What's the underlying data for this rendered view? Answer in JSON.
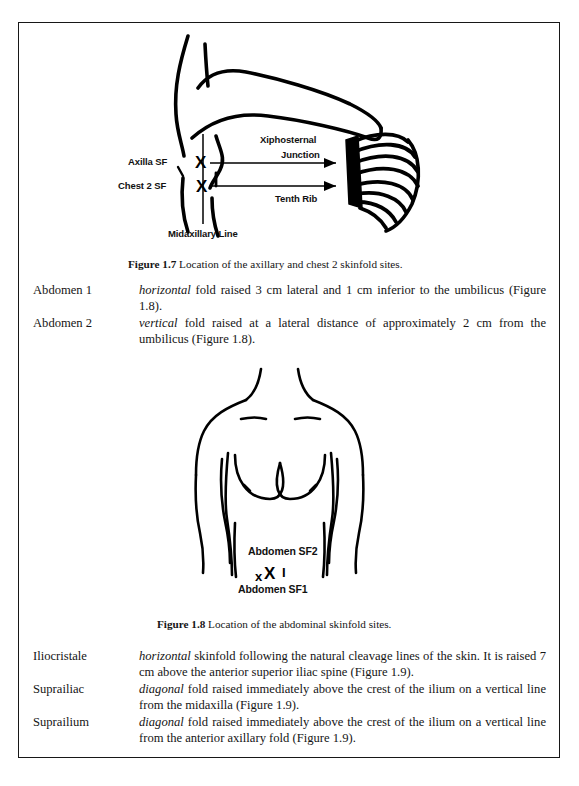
{
  "page": {
    "background_color": "#ffffff",
    "frame_color": "#171717",
    "text_color": "#151515"
  },
  "figure_1_7": {
    "id": "figure-1-7",
    "caption_label": "Figure 1.7",
    "caption_text": "Location of the axillary and chest 2 skinfold sites.",
    "annotations": [
      {
        "name": "axilla-sf-label",
        "text": "Axilla SF"
      },
      {
        "name": "chest-2-sf-label",
        "text": "Chest 2 SF"
      },
      {
        "name": "midaxillary-line-label",
        "text": "Midaxillary Line"
      },
      {
        "name": "xiphosternal-label-line1",
        "text": "Xiphosternal"
      },
      {
        "name": "xiphosternal-label-line2",
        "text": "Junction"
      },
      {
        "name": "tenth-rib-label",
        "text": "Tenth Rib"
      }
    ],
    "markers": [
      {
        "name": "axilla-sf-marker",
        "glyph": "X"
      },
      {
        "name": "chest-2-sf-marker",
        "glyph": "X"
      }
    ]
  },
  "abdomen_definitions": [
    {
      "term": "Abdomen 1",
      "emphasis": "horizontal",
      "description": " fold raised 3 cm lateral and 1 cm inferior to the umbilicus (Figure 1.8)."
    },
    {
      "term": "Abdomen 2",
      "emphasis": "vertical",
      "description": " fold raised at a lateral distance of approximately 2 cm from the umbilicus (Figure 1.8)."
    }
  ],
  "figure_1_8": {
    "id": "figure-1-8",
    "caption_label": "Figure 1.8",
    "caption_text": "Location of the abdominal skinfold sites.",
    "annotations": [
      {
        "name": "abdomen-sf2-label",
        "text": "Abdomen SF2"
      },
      {
        "name": "abdomen-sf1-label",
        "text": "Abdomen SF1"
      }
    ],
    "markers": [
      {
        "name": "abdomen-sf1-marker-small",
        "glyph": "x"
      },
      {
        "name": "abdomen-sf2-marker-large",
        "glyph": "X"
      },
      {
        "name": "abdomen-vertical-fold-marker",
        "glyph": "I"
      }
    ]
  },
  "iliac_definitions": [
    {
      "term": "Iliocristale",
      "emphasis": "horizontal",
      "description": " skinfold following the natural cleavage lines of the skin. It is raised 7 cm above the anterior superior iliac spine (Figure 1.9)."
    },
    {
      "term": "Suprailiac",
      "emphasis": "diagonal",
      "description": " fold raised immediately above the crest of the ilium on a vertical line from the midaxilla (Figure 1.9)."
    },
    {
      "term": "Suprailium",
      "emphasis": "diagonal",
      "description": " fold raised immediately above the crest of the ilium on a vertical line from the anterior axillary fold (Figure 1.9)."
    }
  ]
}
